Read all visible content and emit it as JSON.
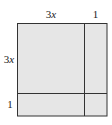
{
  "diagram": {
    "type": "area-model-square",
    "fill_color": "#e6e6e6",
    "stroke_color": "#333333",
    "top_labels": [
      {
        "coef": "3",
        "var": "x"
      },
      {
        "coef": "1",
        "var": ""
      }
    ],
    "left_labels": [
      {
        "coef": "3",
        "var": "x"
      },
      {
        "coef": "1",
        "var": ""
      }
    ],
    "regions": [
      {
        "row": "3x",
        "col": "3x"
      },
      {
        "row": "3x",
        "col": "1"
      },
      {
        "row": "1",
        "col": "3x"
      },
      {
        "row": "1",
        "col": "1"
      }
    ]
  }
}
